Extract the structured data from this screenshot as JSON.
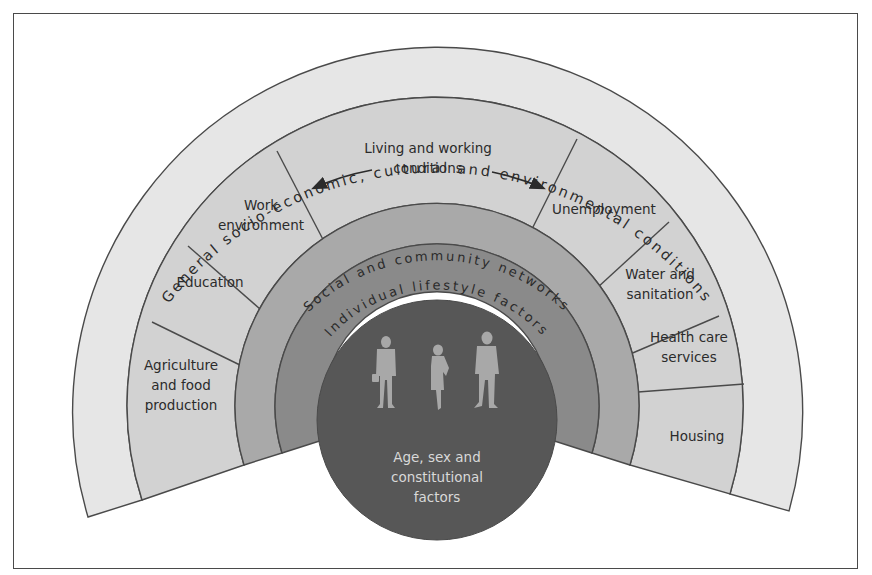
{
  "diagram": {
    "type": "concentric-rainbow-model",
    "layers": [
      {
        "id": "outer",
        "label": "General socio-economic, cultural and environmental conditions",
        "color": "#e6e6e6"
      },
      {
        "id": "living",
        "label": "Living and working conditions",
        "color": "#d2d2d2"
      },
      {
        "id": "social",
        "label": "Social and community networks",
        "color": "#a9a9a9"
      },
      {
        "id": "lifestyle",
        "label": "Individual lifestyle factors",
        "color": "#8a8a8a"
      },
      {
        "id": "core",
        "label_lines": [
          "Age, sex and",
          "constitutional",
          "factors"
        ],
        "color": "#575757"
      }
    ],
    "living_segments": [
      {
        "label_lines": [
          "Agriculture",
          "and food",
          "production"
        ]
      },
      {
        "label_lines": [
          "Education"
        ]
      },
      {
        "label_lines": [
          "Work",
          "environment"
        ]
      },
      {
        "label_lines": [
          "Living and working",
          "conditions"
        ]
      },
      {
        "label_lines": [
          "Unemployment"
        ]
      },
      {
        "label_lines": [
          "Water and",
          "sanitation"
        ]
      },
      {
        "label_lines": [
          "Health care",
          "services"
        ]
      },
      {
        "label_lines": [
          "Housing"
        ]
      }
    ],
    "icons": {
      "people": [
        "person-silhouette-icon",
        "person-silhouette-icon",
        "person-silhouette-icon"
      ],
      "arrows": [
        "arrow-left-icon",
        "arrow-right-icon"
      ]
    },
    "colors": {
      "line": "#4a4a4a",
      "text_dark": "#2b2b2b",
      "text_light": "#d9d9d9",
      "people": "#a8a8a8"
    }
  }
}
